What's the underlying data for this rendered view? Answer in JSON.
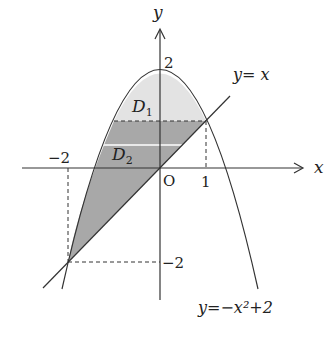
{
  "diagram": {
    "axes": {
      "x_label": "x",
      "y_label": "y",
      "origin_label": "O"
    },
    "ticks": {
      "x_neg2": "−2",
      "x_1": "1",
      "y_2": "2",
      "y_neg2": "−2"
    },
    "curves": {
      "line_label": "y= x",
      "parabola_label": "y=−x²+2"
    },
    "regions": {
      "d1": "D",
      "d1_sub": "1",
      "d2": "D",
      "d2_sub": "2"
    },
    "colors": {
      "d1_fill": "#e3e3e3",
      "d2_fill": "#a8a8a8",
      "stroke": "#333333"
    }
  }
}
